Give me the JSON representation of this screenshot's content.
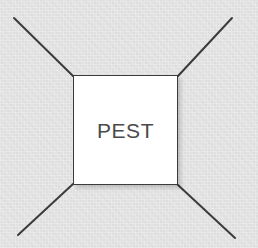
{
  "canvas": {
    "width": 258,
    "height": 248,
    "background_color": "#e3e3e3",
    "texture": "paper-noise"
  },
  "center_node": {
    "label": "PEST",
    "fill_color": "#ffffff",
    "border_color": "#3b3b3b",
    "text_color": "#4a4a4a",
    "shadow_color": "rgba(0,0,0,0.16)",
    "x": 73,
    "y": 75,
    "width": 105,
    "height": 110
  },
  "connectors": {
    "stroke_color": "#3b3b3b",
    "stroke_width": 2,
    "lines": [
      {
        "name": "top-left-branch",
        "x1": 14,
        "y1": 18,
        "x2": 73,
        "y2": 76
      },
      {
        "name": "top-right-branch",
        "x1": 232,
        "y1": 18,
        "x2": 178,
        "y2": 76
      },
      {
        "name": "bottom-left-branch",
        "x1": 18,
        "y1": 235,
        "x2": 73,
        "y2": 184
      },
      {
        "name": "bottom-right-branch",
        "x1": 235,
        "y1": 238,
        "x2": 178,
        "y2": 185
      }
    ]
  }
}
